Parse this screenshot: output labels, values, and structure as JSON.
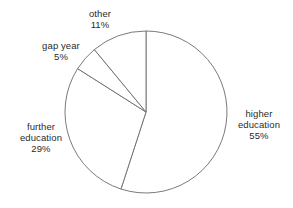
{
  "chart_data": {
    "type": "pie",
    "title": "",
    "subtitle": "",
    "xlabel": "",
    "ylabel": "",
    "grid": false,
    "legend": "none",
    "label_position": "outside",
    "start_angle_deg": 0,
    "direction": "clockwise",
    "units": "%",
    "categories": [
      "higher education",
      "further education",
      "gap year",
      "other"
    ],
    "values": [
      55,
      29,
      5,
      11
    ],
    "slices": [
      {
        "name": "higher-education",
        "label": "higher education",
        "label_line_1": "higher",
        "label_line_2": "education",
        "value": 55,
        "value_text": "55%",
        "color": "#ffffff",
        "stroke": "#6b6b6b"
      },
      {
        "name": "further-education",
        "label": "further education",
        "label_line_1": "further",
        "label_line_2": "education",
        "value": 29,
        "value_text": "29%",
        "color": "#ffffff",
        "stroke": "#6b6b6b"
      },
      {
        "name": "gap-year",
        "label": "gap year",
        "label_line_1": "gap year",
        "label_line_2": "",
        "value": 5,
        "value_text": "5%",
        "color": "#ffffff",
        "stroke": "#6b6b6b"
      },
      {
        "name": "other",
        "label": "other",
        "label_line_1": "other",
        "label_line_2": "",
        "value": 11,
        "value_text": "11%",
        "color": "#ffffff",
        "stroke": "#6b6b6b"
      }
    ],
    "geometry": {
      "center_x": 146,
      "center_y": 112,
      "radius": 81
    },
    "colors": {
      "background": "#ffffff",
      "outline": "#6b6b6b",
      "text": "#2b2b2b"
    }
  }
}
